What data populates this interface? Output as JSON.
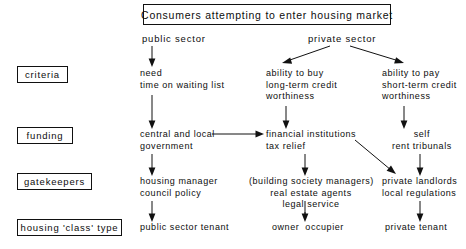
{
  "diagram": {
    "title_box": "Consumers attempting to enter housing market",
    "branches": {
      "public": "public sector",
      "private": "private sector"
    },
    "row_labels": [
      "criteria",
      "funding",
      "gatekeepers",
      "housing 'class' type"
    ],
    "columns": {
      "public_sector": {
        "criteria": "need\ntime on waiting list",
        "funding": "central and local\ngovernment",
        "gatekeepers": "housing manager\ncouncil policy",
        "class_type": "public sector tenant"
      },
      "private_buy": {
        "criteria": "ability to buy\nlong-term credit\nworthiness",
        "funding": "financial institutions\ntax relief",
        "gatekeepers": "(building society managers)\nreal estate agents\nlegal service",
        "class_type": "owner  occupier"
      },
      "private_rent": {
        "criteria": "ability to pay\nshort-term credit\nworthiness",
        "funding": "self\nrent tribunals",
        "gatekeepers": "private landlords\nlocal regulations",
        "class_type": "private tenant"
      }
    },
    "colors": {
      "ink": "#111111",
      "paper": "#ffffff"
    }
  }
}
